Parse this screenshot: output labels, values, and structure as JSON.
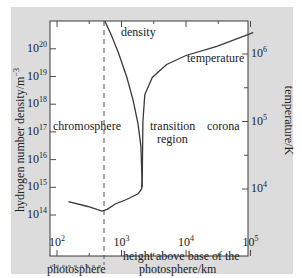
{
  "chart_data": {
    "type": "line",
    "title": "",
    "xlabel": "height above base of the photosphere/km",
    "xlabel_lines": [
      "height above base of the",
      "photosphere/km"
    ],
    "xscale": "log",
    "xlim": [
      100,
      110000
    ],
    "x_ticks": [
      {
        "base": "10",
        "exp": "2",
        "value": 100
      },
      {
        "base": "10",
        "exp": "3",
        "value": 1000
      },
      {
        "base": "10",
        "exp": "4",
        "value": 10000
      },
      {
        "base": "10",
        "exp": "5",
        "value": 100000
      }
    ],
    "ylabel_left": "hydrogen number density/m⁻³",
    "ylabel_left_base": "hydrogen number density/m",
    "ylabel_left_exp": "−3",
    "yscale_left": "log",
    "ylim_left": [
      30000000000000.0,
      1e+21
    ],
    "y_ticks_left": [
      {
        "base": "10",
        "exp": "14",
        "value": 100000000000000.0
      },
      {
        "base": "10",
        "exp": "15",
        "value": 1000000000000000.0
      },
      {
        "base": "10",
        "exp": "16",
        "value": 1e+16
      },
      {
        "base": "10",
        "exp": "17",
        "value": 1e+17
      },
      {
        "base": "10",
        "exp": "18",
        "value": 1e+18
      },
      {
        "base": "10",
        "exp": "19",
        "value": 1e+19
      },
      {
        "base": "10",
        "exp": "20",
        "value": 1e+20
      }
    ],
    "ylabel_right": "temperature/K",
    "yscale_right": "log",
    "ylim_right": [
      4500,
      2500000
    ],
    "y_ticks_right": [
      {
        "base": "10",
        "exp": "4",
        "value": 10000
      },
      {
        "base": "10",
        "exp": "5",
        "value": 100000
      },
      {
        "base": "10",
        "exp": "6",
        "value": 1000000
      }
    ],
    "grid": false,
    "legend": "none (curves labelled directly)",
    "series": [
      {
        "name": "density",
        "axis": "left",
        "x": [
          550,
          700,
          900,
          1200,
          1500,
          1800,
          2000,
          2100
        ],
        "y": [
          1e+21,
          3e+20,
          7e+19,
          1e+19,
          1.5e+18,
          2e+17,
          3e+16,
          1000000000000000.0
        ]
      },
      {
        "name": "temperature",
        "axis": "right",
        "x": [
          150,
          300,
          500,
          600,
          800,
          1200,
          1800,
          2050,
          2100,
          2150,
          2300,
          3000,
          5000,
          10000,
          30000,
          100000,
          110000
        ],
        "y": [
          6500,
          5500,
          4700,
          5000,
          6000,
          7000,
          8500,
          10000,
          16000,
          100000,
          250000,
          450000,
          700000,
          950000,
          1300000,
          2000000,
          2100000
        ]
      }
    ],
    "annotations": [
      {
        "text": "density",
        "near": "density curve top"
      },
      {
        "text": "temperature",
        "near": "temperature curve upper right"
      },
      {
        "text": "chromosphere",
        "region": "x 100-2000 km"
      },
      {
        "text": "transition region",
        "region": "x ~2000 km"
      },
      {
        "text": "corona",
        "region": "x > 10^4 km"
      },
      {
        "text": "photosphere",
        "region": "below x-axis, x 100-500 km"
      }
    ],
    "dashed_line_x": 500
  },
  "labels": {
    "density": "density",
    "temperature": "temperature",
    "chromosphere": "chromosphere",
    "transition_1": "transition",
    "transition_2": "region",
    "corona": "corona",
    "photosphere": "photosphere",
    "xlabel_1": "height above base of the",
    "xlabel_2": "photosphere/km",
    "ylabel_left": "hydrogen number density/m",
    "ylabel_left_exp": "−3",
    "ylabel_right": "temperature/K"
  },
  "colors": {
    "figure_bg": "#dcdcdc",
    "plot_bg": "#ffffff",
    "line": "#3a3a3a",
    "text": "#222222"
  }
}
